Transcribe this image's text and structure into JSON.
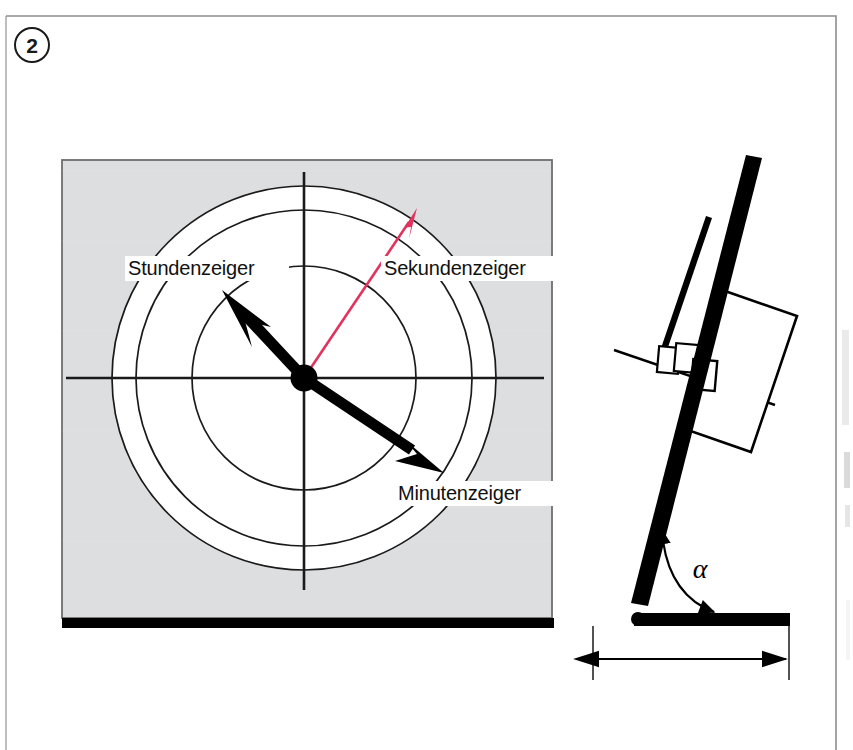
{
  "figure": {
    "marker_number": "2",
    "page_border_color": "#8a8a8a",
    "background_color": "#ffffff"
  },
  "clock_panel": {
    "name": "clock-face-panel",
    "panel_fill": "#dcdee0",
    "panel_border_color": "#6e6e6e",
    "base_bar_color": "#000000",
    "axis_color": "#1a1a1a",
    "circle_color": "#1a1a1a",
    "hub_color": "#000000",
    "center": {
      "x": 304,
      "y": 378
    },
    "circle_radii": [
      112,
      168,
      192
    ],
    "labels": [
      {
        "id": "hour-hand-label",
        "text": "Stundenzeiger",
        "x": 128,
        "y": 276,
        "anchor": "start"
      },
      {
        "id": "second-hand-label",
        "text": "Sekundenzeiger",
        "x": 384,
        "y": 276,
        "anchor": "start"
      },
      {
        "id": "minute-hand-label",
        "text": "Minutenzeiger",
        "x": 398,
        "y": 500,
        "anchor": "start"
      }
    ],
    "hands": [
      {
        "id": "hour-hand",
        "label": "Stundenzeiger",
        "color": "#000000",
        "tip": {
          "x": 226,
          "y": 294
        },
        "length": 119,
        "width": 9
      },
      {
        "id": "minute-hand",
        "label": "Minutenzeiger",
        "color": "#000000",
        "tip": {
          "x": 436,
          "y": 470
        },
        "length": 178,
        "width": 9
      },
      {
        "id": "second-hand",
        "label": "Sekundenzeiger",
        "color": "#e0335e",
        "tip": {
          "x": 415,
          "y": 212
        },
        "length": 198,
        "width": 2.4
      }
    ]
  },
  "stand_panel": {
    "name": "tilted-stand-diagram",
    "line_color": "#000000",
    "angle_symbol": "α",
    "angle_symbol_position": {
      "x": 700,
      "y": 575
    },
    "arm_color": "#000000",
    "dimension_line": {
      "name": "width-dimension",
      "y": 660,
      "x_start": 593,
      "x_end": 789
    },
    "mechanism": {
      "name": "clock-body-rectangle",
      "stroke": "#000000"
    }
  }
}
